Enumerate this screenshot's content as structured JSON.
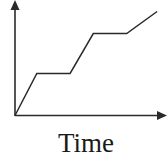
{
  "chart_data": {
    "type": "line",
    "title": "",
    "xlabel": "Time",
    "ylabel": "",
    "grid": false,
    "legend": null,
    "axis_ticks": "none",
    "series": [
      {
        "name": "value",
        "x": [
          0,
          0.15,
          0.38,
          0.54,
          0.77,
          0.98
        ],
        "y": [
          0,
          0.4,
          0.4,
          0.78,
          0.78,
          0.99
        ]
      }
    ]
  },
  "colors": {
    "line": "#2a2a2a",
    "axis": "#2a2a2a"
  }
}
